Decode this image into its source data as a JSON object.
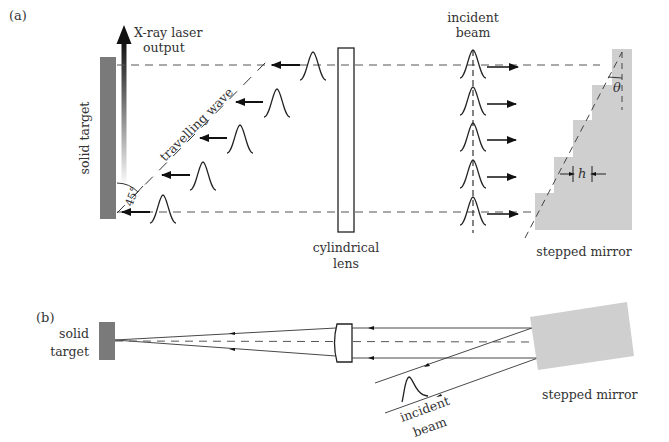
{
  "panel_a": {
    "label": "(a)",
    "solid_target": "solid target",
    "xray_output_line1": "X-ray laser",
    "xray_output_line2": "output",
    "travelling_wave": "travelling wave",
    "angle": "45°",
    "lens_line1": "cylindrical",
    "lens_line2": "lens",
    "incident_line1": "incident",
    "incident_line2": "beam",
    "stepped_mirror": "stepped mirror",
    "theta": "θ",
    "step_height": "h"
  },
  "panel_b": {
    "label": "(b)",
    "solid_line1": "solid",
    "solid_line2": "target",
    "incident_line1": "incident",
    "incident_line2": "beam",
    "stepped_mirror": "stepped mirror"
  },
  "colors": {
    "target": "#7a7a7a",
    "mirror": "#cfcfcf",
    "line": "#222222",
    "dash": "#555555"
  }
}
